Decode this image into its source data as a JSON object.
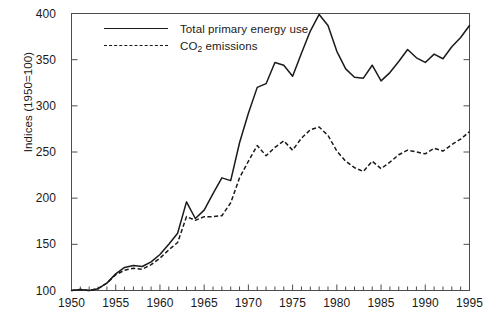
{
  "chart_data": {
    "type": "line",
    "title": "",
    "subtitle": "",
    "xlabel": "",
    "ylabel": "Indices (1950=100)",
    "xlim": [
      1950,
      1995
    ],
    "ylim": [
      100,
      400
    ],
    "yticks": [
      100,
      150,
      200,
      250,
      300,
      350,
      400
    ],
    "xticks": [
      1950,
      1955,
      1960,
      1965,
      1970,
      1975,
      1980,
      1985,
      1990,
      1995
    ],
    "xminor_step": 1,
    "grid": false,
    "legend_position": "top-left inside",
    "x": [
      1950,
      1951,
      1952,
      1953,
      1954,
      1955,
      1956,
      1957,
      1958,
      1959,
      1960,
      1961,
      1962,
      1963,
      1964,
      1965,
      1966,
      1967,
      1968,
      1969,
      1970,
      1971,
      1972,
      1973,
      1974,
      1975,
      1976,
      1977,
      1978,
      1979,
      1980,
      1981,
      1982,
      1983,
      1984,
      1985,
      1986,
      1987,
      1988,
      1989,
      1990,
      1991,
      1992,
      1993,
      1994,
      1995
    ],
    "series": [
      {
        "name": "Total primary energy use",
        "style": "solid",
        "color": "#1a1a1a",
        "values": [
          100,
          101,
          100,
          102,
          108,
          118,
          125,
          127,
          126,
          131,
          139,
          150,
          162,
          196,
          178,
          187,
          205,
          222,
          219,
          260,
          292,
          320,
          324,
          347,
          344,
          332,
          357,
          381,
          399,
          387,
          359,
          340,
          331,
          330,
          344,
          327,
          336,
          348,
          361,
          352,
          347,
          356,
          351,
          364,
          374,
          387
        ]
      },
      {
        "name": "CO2 emissions",
        "label_html": "CO<sub>2</sub> emissions",
        "style": "dashed",
        "color": "#1a1a1a",
        "values": [
          100,
          101,
          100,
          102,
          108,
          117,
          122,
          124,
          123,
          128,
          135,
          144,
          152,
          180,
          176,
          180,
          180,
          181,
          195,
          222,
          240,
          257,
          246,
          255,
          262,
          252,
          265,
          274,
          277,
          268,
          251,
          240,
          233,
          229,
          240,
          232,
          239,
          247,
          252,
          250,
          248,
          254,
          251,
          258,
          264,
          272
        ]
      }
    ]
  },
  "legend": {
    "items": [
      {
        "label": "Total primary energy use",
        "style": "solid"
      },
      {
        "label": "CO2 emissions",
        "style": "dashed"
      }
    ]
  },
  "axes": {
    "y_title": "Indices (1950=100)",
    "y_tick_labels": [
      "400",
      "350",
      "300",
      "250",
      "200",
      "150",
      "100"
    ],
    "x_tick_labels": [
      "1950",
      "1955",
      "1960",
      "1965",
      "1970",
      "1975",
      "1980",
      "1985",
      "1990",
      "1995"
    ]
  },
  "colors": {
    "line": "#1a1a1a",
    "frame": "#4d4d4d",
    "background": "#ffffff"
  }
}
